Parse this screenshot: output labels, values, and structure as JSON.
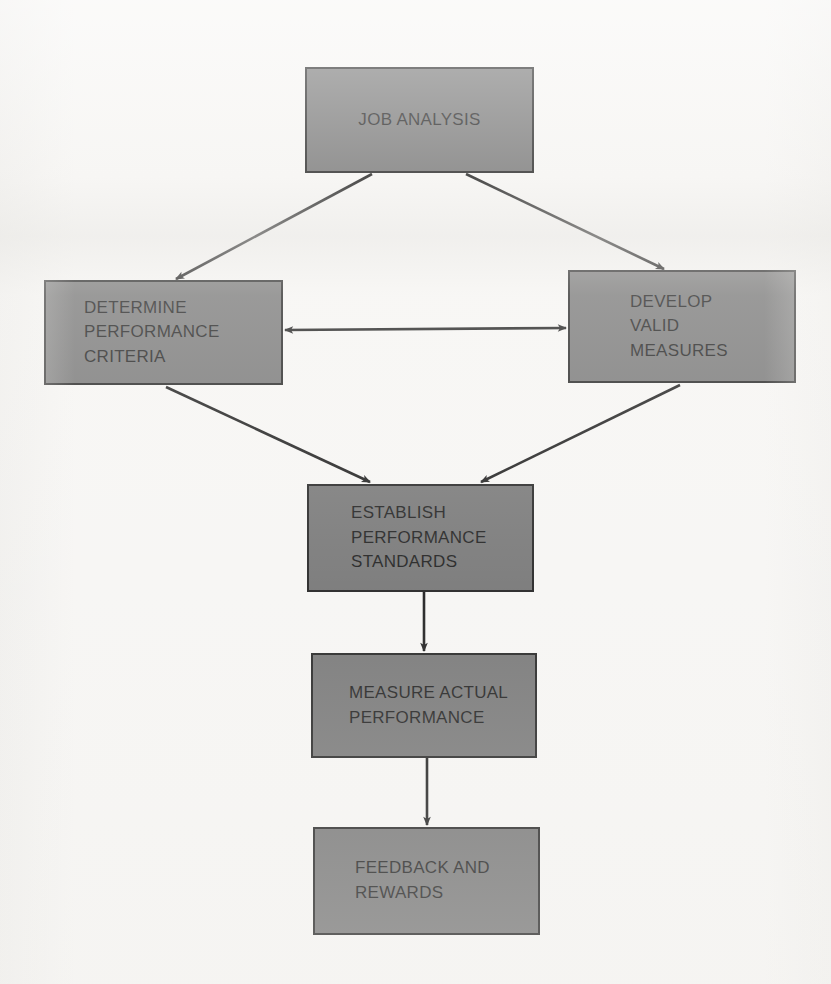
{
  "diagram": {
    "background_color": "#f6f5f3",
    "node_fill_color": "#707070",
    "node_border_color": "#1b1b1b",
    "text_color": "#141414",
    "nodes": [
      {
        "id": "job-analysis",
        "label": "JOB ANALYSIS",
        "x": 305,
        "y": 67,
        "w": 229,
        "h": 106,
        "align": "center",
        "text_indent": 0
      },
      {
        "id": "determine-performance-criteria",
        "label": "DETERMINE\nPERFORMANCE\nCRITERIA",
        "x": 44,
        "y": 280,
        "w": 239,
        "h": 105,
        "align": "left",
        "text_indent": 38
      },
      {
        "id": "develop-valid-measures",
        "label": "DEVELOP\nVALID\nMEASURES",
        "x": 568,
        "y": 270,
        "w": 228,
        "h": 113,
        "align": "left",
        "text_indent": 60
      },
      {
        "id": "establish-performance-standards",
        "label": "ESTABLISH\nPERFORMANCE\nSTANDARDS",
        "x": 307,
        "y": 484,
        "w": 227,
        "h": 108,
        "align": "left",
        "text_indent": 42
      },
      {
        "id": "measure-actual-performance",
        "label": "MEASURE ACTUAL\nPERFORMANCE",
        "x": 311,
        "y": 653,
        "w": 226,
        "h": 105,
        "align": "left",
        "text_indent": 36
      },
      {
        "id": "feedback-and-rewards",
        "label": "FEEDBACK AND\nREWARDS",
        "x": 313,
        "y": 827,
        "w": 227,
        "h": 108,
        "align": "left",
        "text_indent": 40
      }
    ],
    "edges": [
      {
        "id": "job-analysis-to-determine-criteria",
        "from": "job-analysis",
        "to": "determine-performance-criteria",
        "kind": "arrow",
        "direction": "one-way",
        "x1": 372,
        "y1": 174,
        "x2": 176,
        "y2": 279
      },
      {
        "id": "job-analysis-to-develop-measures",
        "from": "job-analysis",
        "to": "develop-valid-measures",
        "kind": "arrow",
        "direction": "one-way",
        "x1": 466,
        "y1": 174,
        "x2": 664,
        "y2": 269
      },
      {
        "id": "determine-criteria-to-develop-measures",
        "from": "determine-performance-criteria",
        "to": "develop-valid-measures",
        "kind": "arrow",
        "direction": "two-way",
        "x1": 285,
        "y1": 330,
        "x2": 566,
        "y2": 328
      },
      {
        "id": "determine-criteria-to-establish-standards",
        "from": "determine-performance-criteria",
        "to": "establish-performance-standards",
        "kind": "arrow",
        "direction": "one-way",
        "x1": 166,
        "y1": 387,
        "x2": 370,
        "y2": 482
      },
      {
        "id": "develop-measures-to-establish-standards",
        "from": "develop-valid-measures",
        "to": "establish-performance-standards",
        "kind": "arrow",
        "direction": "one-way",
        "x1": 680,
        "y1": 385,
        "x2": 481,
        "y2": 482
      },
      {
        "id": "establish-standards-to-measure-performance",
        "from": "establish-performance-standards",
        "to": "measure-actual-performance",
        "kind": "arrow",
        "direction": "one-way",
        "x1": 424,
        "y1": 592,
        "x2": 424,
        "y2": 651
      },
      {
        "id": "measure-performance-to-feedback",
        "from": "measure-actual-performance",
        "to": "feedback-and-rewards",
        "kind": "arrow",
        "direction": "one-way",
        "x1": 427,
        "y1": 758,
        "x2": 427,
        "y2": 825
      }
    ]
  }
}
